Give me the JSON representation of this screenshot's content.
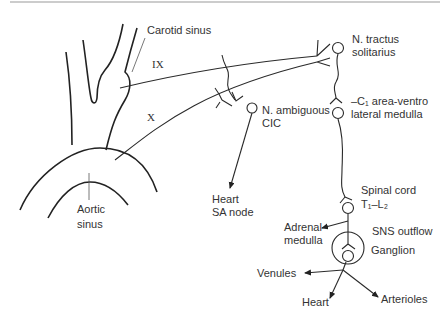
{
  "diagram": {
    "type": "baroreflex pathway schematic",
    "nerves": {
      "glossopharyngeal": "IX",
      "vagus": "X"
    },
    "labels": {
      "carotid_sinus": "Carotid sinus",
      "aortic_sinus_line1": "Aortic",
      "aortic_sinus_line2": "sinus",
      "nts_line1": "N. tractus",
      "nts_line2": "solitarius",
      "c1_line1": "–C₁ area-ventro",
      "c1_line2": "lateral medulla",
      "n_ambiguous_line1": "N. ambiguous",
      "n_ambiguous_line2": "CIC",
      "heart_sa_line1": "Heart",
      "heart_sa_line2": "SA node",
      "spinal_line1": "Spinal cord",
      "spinal_line2": "T₁–L₂",
      "adrenal_line1": "Adrenal",
      "adrenal_line2": "medulla",
      "sns_outflow": "SNS outflow",
      "ganglion": "Ganglion",
      "venules": "Venules",
      "heart": "Heart",
      "arterioles": "Arterioles"
    },
    "colors": {
      "stroke": "#222222",
      "text": "#333333",
      "background": "#ffffff"
    }
  }
}
